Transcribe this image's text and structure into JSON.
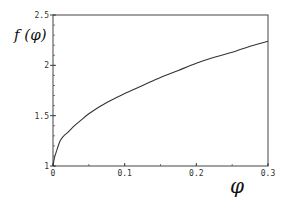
{
  "chart_data": {
    "type": "line",
    "title": "",
    "xlabel": "φ",
    "ylabel": "f (φ)",
    "xlim": [
      0,
      0.3
    ],
    "ylim": [
      1,
      2.5
    ],
    "grid": false,
    "legend": null,
    "x_ticks": [
      {
        "value": 0,
        "label": "0"
      },
      {
        "value": 0.1,
        "label": "0.1"
      },
      {
        "value": 0.2,
        "label": "0.2"
      },
      {
        "value": 0.3,
        "label": "0.3"
      }
    ],
    "y_ticks": [
      {
        "value": 1,
        "label": "1"
      },
      {
        "value": 1.5,
        "label": "1.5"
      },
      {
        "value": 2,
        "label": "2"
      },
      {
        "value": 2.5,
        "label": "2.5"
      }
    ],
    "y_minor_step": 0.1,
    "x_minor_step": 0.05,
    "series": [
      {
        "name": "f(φ)",
        "color": "#333333",
        "x": [
          0,
          0.002,
          0.005,
          0.01,
          0.015,
          0.02,
          0.03,
          0.04,
          0.05,
          0.075,
          0.1,
          0.125,
          0.15,
          0.175,
          0.2,
          0.225,
          0.25,
          0.275,
          0.3
        ],
        "y": [
          1.0,
          1.08,
          1.15,
          1.25,
          1.3,
          1.33,
          1.4,
          1.46,
          1.52,
          1.63,
          1.72,
          1.8,
          1.88,
          1.95,
          2.02,
          2.08,
          2.13,
          2.19,
          2.24
        ]
      }
    ]
  }
}
